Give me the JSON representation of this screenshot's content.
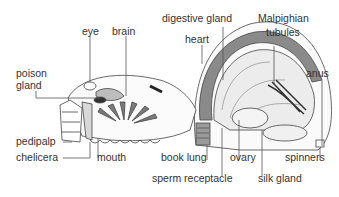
{
  "colors": {
    "line": "#444444",
    "dark_fill": "#6e6e6e",
    "mid_fill": "#a8a8a8",
    "light_fill": "#e6e6e6",
    "label": "#333333"
  },
  "labels": {
    "eye": "eye",
    "brain": "brain",
    "poison_gland_1": "poison",
    "poison_gland_2": "gland",
    "digestive_gland": "digestive gland",
    "heart": "heart",
    "malpighian_1": "Malpighian",
    "malpighian_2": "tubules",
    "anus": "anus",
    "pedipalp": "pedipalp",
    "chelicera": "chelicera",
    "mouth": "mouth",
    "book_lung": "book lung",
    "ovary": "ovary",
    "spinners": "spinners",
    "sperm_receptacle": "sperm receptacle",
    "silk_gland": "silk gland"
  }
}
